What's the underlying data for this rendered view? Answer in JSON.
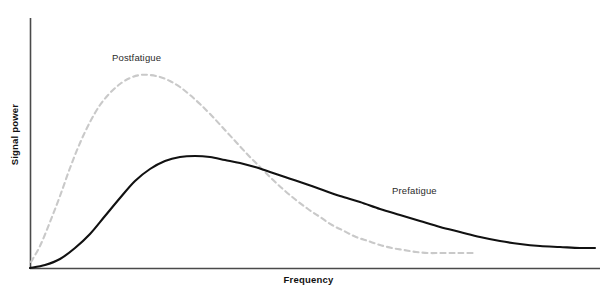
{
  "chart_data": {
    "type": "line",
    "title": "",
    "xlabel": "Frequency",
    "ylabel": "Signal power",
    "grid": false,
    "legend_position": "inline-annotations",
    "axes": {
      "x_ticks": [],
      "y_ticks": [],
      "x_origin_px": 30,
      "x_end_px": 600,
      "y_top_px": 18,
      "y_baseline_px": 268
    },
    "series": [
      {
        "name": "Prefatigue",
        "style": "solid",
        "color": "#111111",
        "width": 2.1,
        "label_text": "Prefatigue",
        "peak": {
          "x": 185,
          "y": 156
        },
        "points": [
          [
            30,
            268
          ],
          [
            45,
            265
          ],
          [
            60,
            259
          ],
          [
            75,
            248
          ],
          [
            90,
            234
          ],
          [
            105,
            216
          ],
          [
            120,
            198
          ],
          [
            135,
            181
          ],
          [
            150,
            169
          ],
          [
            165,
            161
          ],
          [
            180,
            157
          ],
          [
            195,
            156
          ],
          [
            210,
            157
          ],
          [
            225,
            160
          ],
          [
            240,
            163
          ],
          [
            255,
            167
          ],
          [
            270,
            172
          ],
          [
            285,
            177
          ],
          [
            300,
            182
          ],
          [
            320,
            189
          ],
          [
            340,
            196
          ],
          [
            360,
            202
          ],
          [
            380,
            209
          ],
          [
            400,
            215
          ],
          [
            420,
            221
          ],
          [
            440,
            227
          ],
          [
            460,
            232
          ],
          [
            480,
            237
          ],
          [
            500,
            241
          ],
          [
            520,
            244
          ],
          [
            540,
            246
          ],
          [
            560,
            247
          ],
          [
            580,
            248
          ],
          [
            595,
            248
          ]
        ]
      },
      {
        "name": "Postfatigue",
        "style": "dashed",
        "color": "#c9c9c9",
        "width": 2.1,
        "dash_pattern": "5 4",
        "label_text": "Postfatigue",
        "peak": {
          "x": 148,
          "y": 75
        },
        "points": [
          [
            31,
            262
          ],
          [
            40,
            246
          ],
          [
            50,
            222
          ],
          [
            60,
            196
          ],
          [
            70,
            168
          ],
          [
            80,
            143
          ],
          [
            90,
            122
          ],
          [
            100,
            105
          ],
          [
            110,
            93
          ],
          [
            120,
            84
          ],
          [
            130,
            78
          ],
          [
            140,
            75
          ],
          [
            150,
            75
          ],
          [
            160,
            77
          ],
          [
            170,
            81
          ],
          [
            180,
            87
          ],
          [
            190,
            95
          ],
          [
            200,
            104
          ],
          [
            212,
            116
          ],
          [
            224,
            129
          ],
          [
            236,
            142
          ],
          [
            248,
            155
          ],
          [
            260,
            167
          ],
          [
            272,
            179
          ],
          [
            284,
            190
          ],
          [
            296,
            200
          ],
          [
            308,
            209
          ],
          [
            320,
            217
          ],
          [
            332,
            225
          ],
          [
            344,
            231
          ],
          [
            356,
            237
          ],
          [
            368,
            241
          ],
          [
            380,
            245
          ],
          [
            392,
            248
          ],
          [
            404,
            250
          ],
          [
            416,
            252
          ],
          [
            428,
            253
          ],
          [
            440,
            253
          ],
          [
            452,
            253
          ],
          [
            462,
            253
          ],
          [
            473,
            253
          ]
        ]
      }
    ],
    "annotations": [
      {
        "text": "Postfatigue",
        "x": 112,
        "y": 52,
        "series": "Postfatigue"
      },
      {
        "text": "Prefatigue",
        "x": 392,
        "y": 185,
        "series": "Prefatigue"
      }
    ],
    "colors": {
      "axis": "#4a4a4a",
      "prefatigue": "#111111",
      "postfatigue": "#c9c9c9",
      "background": "#ffffff",
      "label_text": "#2b2b2b"
    }
  }
}
